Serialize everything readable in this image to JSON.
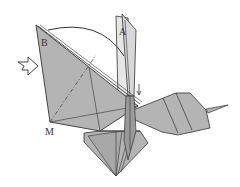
{
  "diagram": {
    "type": "origami-fold-step",
    "labels": {
      "point_a": "A",
      "point_b": "B",
      "point_m": "M"
    },
    "symbols": {
      "push_arrow": "hollow-push-arrow",
      "fold_arrow": "curved-arc-arrow",
      "small_arrow": "small-down-arrow",
      "fold_line": "dash-dot-mountain-line"
    },
    "colors": {
      "paper": "#b4b4b4",
      "paper_light": "#e6e6e6",
      "outline": "#333333",
      "background": "#ffffff"
    }
  }
}
